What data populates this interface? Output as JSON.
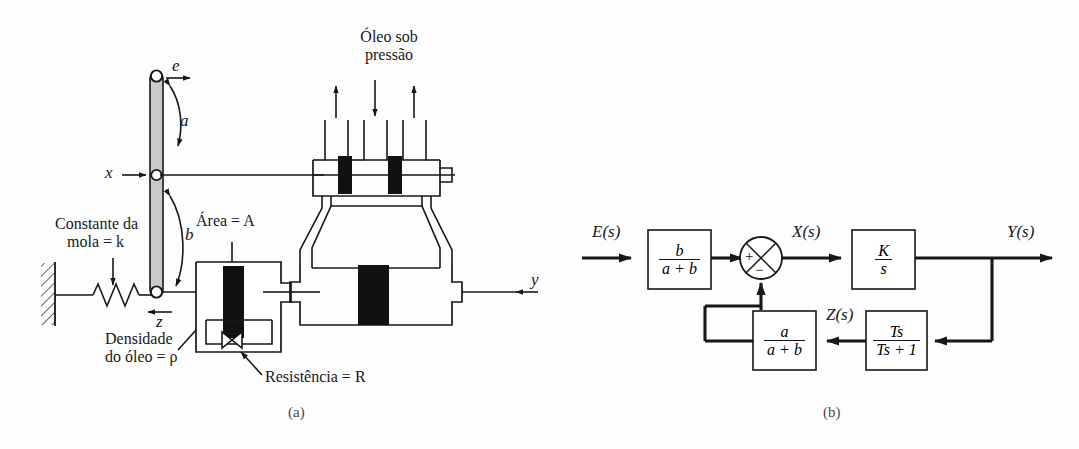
{
  "figure": {
    "language": "pt-BR",
    "background_color": "#fdfdfd",
    "ink_color": "#17171a",
    "lever_fill_color": "#c9c9c9",
    "piston_fill_color": "#111111"
  },
  "panel_a": {
    "caption": "(a)",
    "labels": {
      "oil_supply": "Óleo sob\npressão",
      "oil_supply_line1": "Óleo sob",
      "oil_supply_line2": "pressão",
      "spring_constant_line1": "Constante da",
      "spring_constant_line2": "mola = k",
      "spring_constant_symbol": "k",
      "area": "Área = A",
      "area_symbol": "A",
      "oil_density_line1": "Densidade",
      "oil_density_line2": "do óleo = ρ",
      "oil_density_symbol": "ρ",
      "resistance": "Resistência = R",
      "resistance_symbol": "R",
      "displacement_e": "e",
      "displacement_x": "x",
      "displacement_y": "y",
      "displacement_z": "z",
      "lever_arm_upper": "a",
      "lever_arm_lower": "b"
    },
    "icons": {
      "wall": "hatched-wall-icon",
      "spring": "spring-coil-icon",
      "lever": "lever-bar-icon",
      "pivot": "pivot-joint-icon",
      "dashpot": "dashpot-cylinder-icon",
      "valve": "restriction-valve-icon",
      "spool_valve": "spool-valve-icon",
      "power_cylinder": "power-cylinder-icon",
      "arrow_up_left": "arrow-up-icon",
      "arrow_down_center": "arrow-down-icon",
      "arrow_up_right": "arrow-up-icon"
    }
  },
  "panel_b": {
    "caption": "(b)",
    "signals": {
      "input": "E(s)",
      "after_sum": "X(s)",
      "output": "Y(s)",
      "feedback": "Z(s)"
    },
    "summing_junction": {
      "plus": "+",
      "minus": "−",
      "name": "summing-junction"
    },
    "blocks": [
      {
        "id": "gain-lever-forward",
        "numerator": "b",
        "denominator": "a + b"
      },
      {
        "id": "integrator",
        "numerator": "K",
        "denominator": "s"
      },
      {
        "id": "gain-lever-feedback",
        "numerator": "a",
        "denominator": "a + b"
      },
      {
        "id": "dashpot-washout",
        "numerator": "Ts",
        "denominator": "Ts + 1"
      }
    ]
  }
}
